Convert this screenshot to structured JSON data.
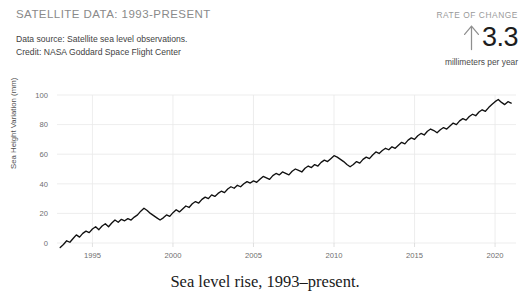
{
  "header": {
    "title": "SATELLITE DATA: 1993-PRESENT",
    "source_line": "Data source: Satellite sea level observations.",
    "credit_line": "Credit: NASA Goddard Space Flight Center"
  },
  "rate_of_change": {
    "label": "RATE OF CHANGE",
    "arrow_icon": "arrow-up-icon",
    "value": "3.3",
    "units": "millimeters per year",
    "value_color": "#1d1d1d",
    "label_color": "#9a9a9a"
  },
  "caption": "Sea level rise, 1993–present.",
  "chart_data": {
    "type": "line",
    "title": "",
    "xlabel": "",
    "ylabel": "Sea Height Variation (mm)",
    "xlim": [
      1992.8,
      2021.3
    ],
    "ylim": [
      -8,
      105
    ],
    "xticks": [
      1995,
      2000,
      2005,
      2010,
      2015,
      2020
    ],
    "yticks": [
      0,
      20,
      40,
      60,
      80,
      100
    ],
    "grid": true,
    "legend": "none",
    "line_color": "#111111",
    "grid_color": "#e9e9e9",
    "series": [
      {
        "name": "Sea Height Variation",
        "x": [
          1993.0,
          1993.2,
          1993.4,
          1993.6,
          1993.8,
          1994.0,
          1994.2,
          1994.4,
          1994.6,
          1994.8,
          1995.0,
          1995.2,
          1995.4,
          1995.6,
          1995.8,
          1996.0,
          1996.2,
          1996.4,
          1996.6,
          1996.8,
          1997.0,
          1997.2,
          1997.4,
          1997.6,
          1997.8,
          1998.0,
          1998.2,
          1998.4,
          1998.6,
          1998.8,
          1999.0,
          1999.2,
          1999.4,
          1999.6,
          1999.8,
          2000.0,
          2000.2,
          2000.4,
          2000.6,
          2000.8,
          2001.0,
          2001.2,
          2001.4,
          2001.6,
          2001.8,
          2002.0,
          2002.2,
          2002.4,
          2002.6,
          2002.8,
          2003.0,
          2003.2,
          2003.4,
          2003.6,
          2003.8,
          2004.0,
          2004.2,
          2004.4,
          2004.6,
          2004.8,
          2005.0,
          2005.2,
          2005.4,
          2005.6,
          2005.8,
          2006.0,
          2006.2,
          2006.4,
          2006.6,
          2006.8,
          2007.0,
          2007.2,
          2007.4,
          2007.6,
          2007.8,
          2008.0,
          2008.2,
          2008.4,
          2008.6,
          2008.8,
          2009.0,
          2009.2,
          2009.4,
          2009.6,
          2009.8,
          2010.0,
          2010.2,
          2010.4,
          2010.6,
          2010.8,
          2011.0,
          2011.2,
          2011.4,
          2011.6,
          2011.8,
          2012.0,
          2012.2,
          2012.4,
          2012.6,
          2012.8,
          2013.0,
          2013.2,
          2013.4,
          2013.6,
          2013.8,
          2014.0,
          2014.2,
          2014.4,
          2014.6,
          2014.8,
          2015.0,
          2015.2,
          2015.4,
          2015.6,
          2015.8,
          2016.0,
          2016.2,
          2016.4,
          2016.6,
          2016.8,
          2017.0,
          2017.2,
          2017.4,
          2017.6,
          2017.8,
          2018.0,
          2018.2,
          2018.4,
          2018.6,
          2018.8,
          2019.0,
          2019.2,
          2019.4,
          2019.6,
          2019.8,
          2020.0,
          2020.2,
          2020.4,
          2020.6,
          2020.8,
          2021.0
        ],
        "y": [
          -3.0,
          -1.0,
          1.5,
          0.5,
          3.0,
          5.5,
          4.0,
          6.5,
          8.0,
          7.0,
          9.5,
          11.0,
          9.0,
          11.5,
          13.0,
          11.0,
          13.5,
          15.5,
          14.0,
          16.0,
          15.0,
          16.5,
          15.5,
          17.5,
          19.0,
          21.5,
          23.5,
          22.0,
          20.0,
          18.5,
          17.0,
          15.5,
          17.0,
          19.0,
          18.0,
          20.5,
          22.5,
          21.0,
          23.0,
          25.0,
          24.0,
          26.5,
          28.0,
          27.0,
          29.5,
          31.0,
          30.0,
          32.5,
          31.5,
          33.5,
          35.0,
          34.0,
          36.5,
          38.0,
          37.0,
          39.0,
          38.0,
          40.0,
          41.5,
          40.5,
          42.0,
          41.0,
          43.0,
          45.0,
          44.0,
          43.0,
          45.5,
          47.0,
          46.0,
          48.0,
          47.0,
          46.0,
          48.5,
          50.0,
          49.0,
          48.0,
          50.5,
          52.0,
          51.0,
          53.0,
          52.0,
          54.5,
          56.0,
          55.0,
          57.0,
          59.0,
          58.0,
          56.5,
          55.0,
          53.0,
          51.5,
          53.0,
          55.0,
          54.0,
          56.5,
          58.0,
          57.0,
          59.5,
          61.5,
          60.5,
          62.5,
          64.0,
          63.0,
          65.0,
          64.0,
          66.0,
          68.0,
          67.0,
          69.5,
          71.0,
          70.0,
          72.5,
          74.0,
          73.0,
          75.5,
          77.0,
          76.0,
          74.5,
          76.5,
          78.0,
          77.0,
          79.0,
          81.0,
          80.0,
          82.5,
          84.0,
          83.0,
          85.5,
          87.0,
          86.0,
          88.5,
          90.0,
          89.0,
          91.5,
          93.5,
          95.5,
          97.0,
          95.0,
          93.5,
          95.5,
          94.5
        ]
      }
    ]
  }
}
